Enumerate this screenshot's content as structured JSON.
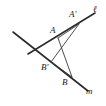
{
  "figure": {
    "kind": "geometry-diagram",
    "width": 106,
    "height": 106,
    "background_color": "#ffffff",
    "stroke_color": "#2b2b2b",
    "segment_color": "#3a3a3a",
    "label_color": "#1a1a1a"
  },
  "lines": [
    {
      "id": "line-ell",
      "label": "ℓ",
      "description": "long line rising to the upper right",
      "x1": 28,
      "y1": 54,
      "x2": 95,
      "y2": 13
    },
    {
      "id": "line-m",
      "label": "m",
      "description": "long line descending to the lower right",
      "x1": 13,
      "y1": 32,
      "x2": 88,
      "y2": 91
    }
  ],
  "points": [
    {
      "id": "point-a",
      "label": "A",
      "x": 58,
      "y": 38,
      "label_x": 50,
      "label_y": 26
    },
    {
      "id": "point-a-prime",
      "label": "A'",
      "x": 79,
      "y": 24,
      "label_x": 69,
      "label_y": 10
    },
    {
      "id": "point-b",
      "label": "B",
      "x": 72,
      "y": 77,
      "label_x": 62,
      "label_y": 78
    },
    {
      "id": "point-b-prime",
      "label": "B'",
      "x": 51,
      "y": 62,
      "label_x": 41,
      "label_y": 63
    }
  ],
  "segments": [
    {
      "id": "segment-a-aprime",
      "from": "A",
      "to": "A'",
      "x1": 58,
      "y1": 38,
      "x2": 79,
      "y2": 24
    },
    {
      "id": "segment-a-b",
      "from": "A",
      "to": "B",
      "x1": 58,
      "y1": 38,
      "x2": 72,
      "y2": 77
    },
    {
      "id": "segment-aprime-bprime",
      "from": "A'",
      "to": "B'",
      "x1": 79,
      "y1": 24,
      "x2": 51,
      "y2": 62
    },
    {
      "id": "segment-bprime-b",
      "from": "B'",
      "to": "B",
      "x1": 51,
      "y1": 62,
      "x2": 72,
      "y2": 77
    }
  ],
  "labels": {
    "ell": "ℓ",
    "m": "m",
    "a": "A",
    "a_prime": "A'",
    "b": "B",
    "b_prime": "B'"
  },
  "label_positions": {
    "ell": {
      "x": 93,
      "y": 5
    },
    "m": {
      "x": 86,
      "y": 87
    }
  }
}
